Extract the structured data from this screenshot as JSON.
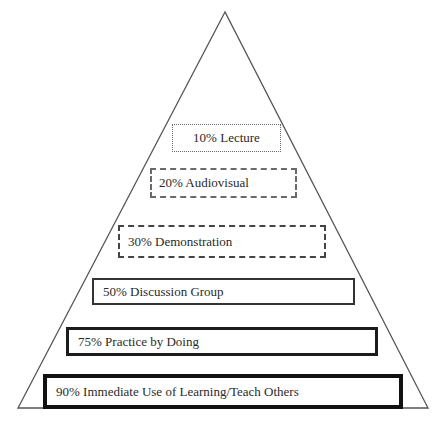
{
  "diagram": {
    "type": "pyramid",
    "title": "",
    "shape": {
      "apex": [
        225,
        12
      ],
      "base_left": [
        18,
        408
      ],
      "base_right": [
        428,
        408
      ],
      "stroke_color": "#555555"
    },
    "tiers": [
      {
        "label": "10% Lecture",
        "percent": 10,
        "activity": "Lecture",
        "border_style": "dotted"
      },
      {
        "label": "20% Audiovisual",
        "percent": 20,
        "activity": "Audiovisual",
        "border_style": "short-dashed"
      },
      {
        "label": "30% Demonstration",
        "percent": 30,
        "activity": "Demonstration",
        "border_style": "long-dashed"
      },
      {
        "label": "50% Discussion Group",
        "percent": 50,
        "activity": "Discussion Group",
        "border_style": "solid-thin"
      },
      {
        "label": "75% Practice by Doing",
        "percent": 75,
        "activity": "Practice by Doing",
        "border_style": "solid-medium"
      },
      {
        "label": "90% Immediate Use of Learning/Teach Others",
        "percent": 90,
        "activity": "Immediate Use of Learning/Teach Others",
        "border_style": "solid-heavy"
      }
    ]
  }
}
